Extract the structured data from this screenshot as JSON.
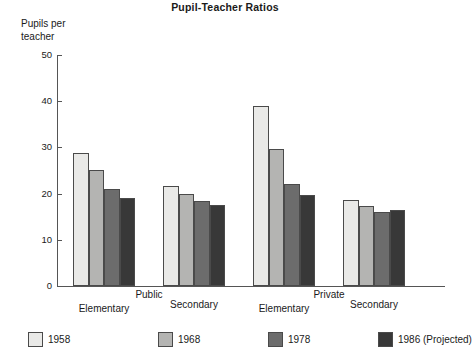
{
  "chart_data": {
    "type": "bar",
    "title": "Pupil-Teacher Ratios",
    "xlabel": "",
    "ylabel": "Pupils per\nteacher",
    "ylim": [
      0,
      50
    ],
    "yticks": [
      0,
      10,
      20,
      30,
      40,
      50
    ],
    "grid": false,
    "legend_position": "bottom",
    "categories": [
      "Elementary",
      "Secondary",
      "Elementary",
      "Secondary"
    ],
    "group_headers": [
      {
        "label": "Public",
        "spans": [
          0,
          1
        ]
      },
      {
        "label": "Private",
        "spans": [
          2,
          3
        ]
      }
    ],
    "series": [
      {
        "name": "1958",
        "color": "#e9e9e7",
        "values": [
          28.8,
          21.6,
          39.0,
          18.7
        ]
      },
      {
        "name": "1968",
        "color": "#b4b4b2",
        "values": [
          25.1,
          20.0,
          29.6,
          17.3
        ]
      },
      {
        "name": "1978",
        "color": "#6c6c6c",
        "values": [
          21.1,
          18.3,
          22.1,
          16.1
        ]
      },
      {
        "name": "1986 (Projected)",
        "color": "#383838",
        "values": [
          19.0,
          17.5,
          19.8,
          16.4
        ]
      }
    ]
  },
  "axis": {
    "tick_labels": [
      "50",
      "40",
      "30",
      "20",
      "10",
      "0"
    ]
  },
  "legend": {
    "items": [
      {
        "label": "1958"
      },
      {
        "label": "1968"
      },
      {
        "label": "1978"
      },
      {
        "label": "1986 (Projected)"
      }
    ]
  }
}
